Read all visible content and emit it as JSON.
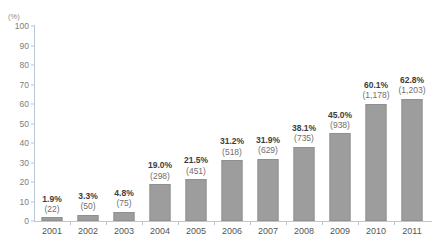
{
  "chart_data": {
    "type": "bar",
    "title": "",
    "subtitle": "",
    "xlabel": "",
    "ylabel": "",
    "unit_label": "(%)",
    "ylim": [
      0,
      100
    ],
    "ytick_step": 10,
    "yticks": [
      "100",
      "90",
      "80",
      "70",
      "60",
      "50",
      "40",
      "30",
      "20",
      "10",
      "0"
    ],
    "grid": false,
    "legend": "none",
    "bar_color": "#9d9d9d",
    "bar_border_color": "#8f8f8f",
    "axis_color": "#b9c8d6",
    "categories": [
      "2001",
      "2002",
      "2003",
      "2004",
      "2005",
      "2006",
      "2007",
      "2008",
      "2009",
      "2010",
      "2011"
    ],
    "values": [
      1.9,
      3.3,
      4.8,
      19.0,
      21.5,
      31.2,
      31.9,
      38.1,
      45.0,
      60.1,
      62.8
    ],
    "percent_labels": [
      "1.9%",
      "3.3%",
      "4.8%",
      "19.0%",
      "21.5%",
      "31.2%",
      "31.9%",
      "38.1%",
      "45.0%",
      "60.1%",
      "62.8%"
    ],
    "count_labels": [
      "(22)",
      "(50)",
      "(75)",
      "(298)",
      "(451)",
      "(518)",
      "(629)",
      "(735)",
      "(938)",
      "(1,178)",
      "(1,203)"
    ],
    "counts": [
      22,
      50,
      75,
      298,
      451,
      518,
      629,
      735,
      938,
      1178,
      1203
    ],
    "series": [
      {
        "name": "",
        "values": [
          1.9,
          3.3,
          4.8,
          19.0,
          21.5,
          31.2,
          31.9,
          38.1,
          45.0,
          60.1,
          62.8
        ]
      }
    ]
  }
}
